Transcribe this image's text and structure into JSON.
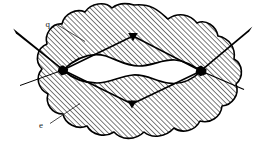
{
  "figure": {
    "background_color": "#ffffff",
    "ink_color": "#000000",
    "hatch_color": "#1a1a1a",
    "width": 269,
    "height": 145
  },
  "labels": {
    "top": {
      "text": "q",
      "x": 50,
      "y": 27,
      "leader_from": [
        57,
        24
      ],
      "leader_to": [
        84,
        41
      ]
    },
    "bottom": {
      "text": "e",
      "x": 43,
      "y": 128,
      "leader_from": [
        50,
        124
      ],
      "leader_to": [
        79,
        104
      ]
    }
  },
  "nodes": [
    {
      "name": "left-vertex",
      "x": 63,
      "y": 70,
      "r": 4.2
    },
    {
      "name": "right-vertex",
      "x": 201,
      "y": 71,
      "r": 4.6
    }
  ],
  "markers": [
    {
      "name": "upper-marker",
      "x": 133,
      "y": 36,
      "orientation": "down"
    },
    {
      "name": "lower-marker",
      "x": 132,
      "y": 104,
      "orientation": "up"
    }
  ],
  "rays": {
    "thick_incoming": [
      {
        "name": "upper-left-ray",
        "from": [
          14,
          31
        ],
        "to": [
          63,
          70
        ],
        "width_start": 3.4,
        "width_end": 1.0
      },
      {
        "name": "upper-right-ray",
        "from": [
          251,
          29
        ],
        "to": [
          201,
          71
        ],
        "width_start": 3.4,
        "width_end": 1.0
      }
    ],
    "thin_outgoing": [
      {
        "name": "lower-left-ray",
        "from": [
          63,
          70
        ],
        "to": [
          21,
          85
        ]
      },
      {
        "name": "lower-right-ray",
        "from": [
          201,
          71
        ],
        "to": [
          243,
          89
        ]
      }
    ],
    "internal": [
      {
        "name": "upper-internal-path",
        "points": "63,70 133,36 201,71"
      },
      {
        "name": "lower-internal-path",
        "points": "63,70 132,104 201,71"
      }
    ]
  },
  "regions": {
    "blob": {
      "name": "hatched-scalloped-blob",
      "fill": "hatch",
      "stroke": "#000000",
      "stroke_width": 1.5
    },
    "cavity": {
      "name": "white-lens-cavity",
      "fill": "#ffffff",
      "stroke": "#000000",
      "stroke_width": 1.5
    }
  },
  "hatch": {
    "angle_deg": 45,
    "spacing": 3.6,
    "line_width": 1.15
  }
}
